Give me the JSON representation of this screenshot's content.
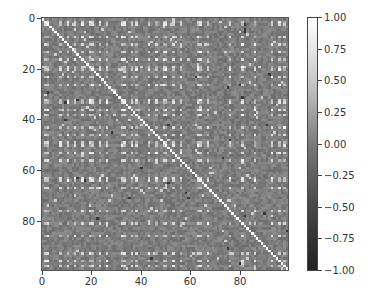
{
  "chart_data": {
    "type": "heatmap",
    "title": "",
    "xlabel": "",
    "ylabel": "",
    "matrix_size": [
      100,
      100
    ],
    "x_ticks": [
      0,
      20,
      40,
      60,
      80
    ],
    "y_ticks": [
      0,
      20,
      40,
      60,
      80
    ],
    "xlim": [
      0,
      99
    ],
    "ylim": [
      99,
      0
    ],
    "diagonal_value": 1.0,
    "colorbar": {
      "range": [
        -1.0,
        1.0
      ],
      "ticks": [
        "1.00",
        "0.75",
        "0.50",
        "0.25",
        "0.00",
        "−0.25",
        "−0.50",
        "−0.75",
        "−1.00"
      ],
      "colormap": "gray"
    },
    "highlight_indices_approx": [
      1,
      2,
      7,
      10,
      13,
      16,
      19,
      20,
      23,
      26,
      32,
      33,
      36,
      38,
      43,
      46,
      49,
      50,
      53,
      56,
      63,
      64,
      67,
      76,
      81,
      86,
      93,
      96,
      98
    ],
    "grid": false,
    "legend": "colorbar right"
  },
  "axes": {
    "x_tick_labels": [
      "0",
      "20",
      "40",
      "60",
      "80"
    ],
    "y_tick_labels": [
      "0",
      "20",
      "40",
      "60",
      "80"
    ]
  },
  "colorbar": {
    "tick_labels": [
      "1.00",
      "0.75",
      "0.50",
      "0.25",
      "0.00",
      "−0.25",
      "−0.50",
      "−0.75",
      "−1.00"
    ]
  }
}
